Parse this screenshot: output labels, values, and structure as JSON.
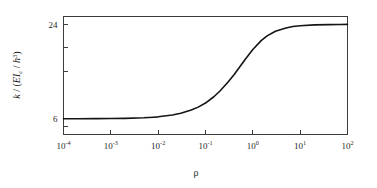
{
  "chart_data": {
    "type": "line",
    "title": "",
    "xlabel": "ρ",
    "ylabel": "k / (EIc / h3)",
    "ylabel_parts": {
      "symbol": "k",
      "slash": " / (",
      "modulus": "EI",
      "modulus_sub": "c",
      "inner_slash": " / ",
      "depth": "h",
      "depth_sup": "3",
      "close": ")"
    },
    "xscale": "log",
    "yscale": "linear",
    "xlim": [
      0.0001,
      100
    ],
    "ylim": [
      3,
      25.5
    ],
    "grid": false,
    "legend": null,
    "xticks": [
      {
        "value": 0.0001,
        "mantissa": "10",
        "exponent": "-4",
        "label": "10-4"
      },
      {
        "value": 0.001,
        "mantissa": "10",
        "exponent": "-3",
        "label": "10-3"
      },
      {
        "value": 0.01,
        "mantissa": "10",
        "exponent": "-2",
        "label": "10-2"
      },
      {
        "value": 0.1,
        "mantissa": "10",
        "exponent": "-1",
        "label": "10-1"
      },
      {
        "value": 1,
        "mantissa": "10",
        "exponent": "0",
        "label": "100"
      },
      {
        "value": 10,
        "mantissa": "10",
        "exponent": "1",
        "label": "101"
      },
      {
        "value": 100,
        "mantissa": "10",
        "exponent": "2",
        "label": "102"
      }
    ],
    "yticks": [
      {
        "value": 24,
        "label": "24",
        "labeled": true
      },
      {
        "value": 19.5,
        "label": "",
        "labeled": false
      },
      {
        "value": 15,
        "label": "",
        "labeled": false
      },
      {
        "value": 6,
        "label": "6",
        "labeled": true
      },
      {
        "value": 4.5,
        "label": "",
        "labeled": false
      }
    ],
    "series": [
      {
        "name": "stiffness-curve",
        "color": "#141414",
        "asymptote_low": 6,
        "asymptote_high": 24,
        "points": [
          {
            "x": 0.0001,
            "y": 6.01
          },
          {
            "x": 0.0002,
            "y": 6.01
          },
          {
            "x": 0.0005,
            "y": 6.02
          },
          {
            "x": 0.001,
            "y": 6.04
          },
          {
            "x": 0.002,
            "y": 6.08
          },
          {
            "x": 0.005,
            "y": 6.19
          },
          {
            "x": 0.008,
            "y": 6.3
          },
          {
            "x": 0.01,
            "y": 6.37
          },
          {
            "x": 0.02,
            "y": 6.72
          },
          {
            "x": 0.03,
            "y": 7.05
          },
          {
            "x": 0.05,
            "y": 7.66
          },
          {
            "x": 0.07,
            "y": 8.22
          },
          {
            "x": 0.1,
            "y": 9.0
          },
          {
            "x": 0.15,
            "y": 10.2
          },
          {
            "x": 0.2,
            "y": 11.25
          },
          {
            "x": 0.3,
            "y": 13.0
          },
          {
            "x": 0.4,
            "y": 14.4
          },
          {
            "x": 0.5,
            "y": 15.6
          },
          {
            "x": 0.7,
            "y": 17.4
          },
          {
            "x": 1.0,
            "y": 19.2
          },
          {
            "x": 1.5,
            "y": 20.9
          },
          {
            "x": 2.0,
            "y": 21.8
          },
          {
            "x": 3.0,
            "y": 22.7
          },
          {
            "x": 5.0,
            "y": 23.3
          },
          {
            "x": 7.0,
            "y": 23.6
          },
          {
            "x": 10.0,
            "y": 23.75
          },
          {
            "x": 20.0,
            "y": 23.9
          },
          {
            "x": 40.0,
            "y": 23.96
          },
          {
            "x": 70.0,
            "y": 23.98
          },
          {
            "x": 100.0,
            "y": 24.0
          }
        ]
      }
    ]
  }
}
